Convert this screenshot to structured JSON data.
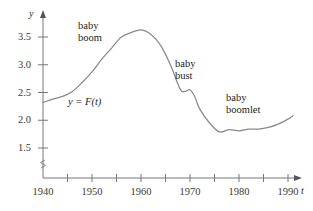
{
  "figure": {
    "name": "us-birth-rate-figure",
    "curve_label": "y = F(t)",
    "axis_x_name": "t",
    "axis_y_name": "y",
    "line_color": "#8a8a8d",
    "axis_color": "#77777a",
    "background": "#ffffff"
  },
  "annotations": [
    {
      "id": "baby-boom",
      "line1": "baby",
      "line2": "boom",
      "x": 78,
      "y": 20
    },
    {
      "id": "baby-bust",
      "line1": "baby",
      "line2": "bust",
      "x": 175,
      "y": 58
    },
    {
      "id": "baby-boomlet",
      "line1": "baby",
      "line2": "boomlet",
      "x": 226,
      "y": 92
    }
  ],
  "chart_data": {
    "type": "line",
    "title": "",
    "subtitle": "",
    "xlabel": "t",
    "ylabel": "y",
    "legend": [
      "y = F(t)"
    ],
    "legend_position": "inline-on-curve",
    "grid": false,
    "xlim": [
      1940,
      1993
    ],
    "ylim": [
      1.25,
      3.8
    ],
    "y_axis_break": true,
    "y_axis_break_note": "zig-zag break between origin and 1.5",
    "xticks": [
      1940,
      1950,
      1960,
      1970,
      1980,
      1990
    ],
    "xticks_minor": [
      1945,
      1955,
      1965,
      1975,
      1985
    ],
    "xtick_labels": [
      "1940",
      "1950",
      "1960",
      "1970",
      "1980",
      "1990"
    ],
    "yticks": [
      1.5,
      2.0,
      2.5,
      3.0,
      3.5
    ],
    "ytick_labels": [
      "1.5",
      "2.0",
      "2.5",
      "3.0",
      "3.5"
    ],
    "series": [
      {
        "name": "y = F(t)",
        "color": "#8a8a8d",
        "x": [
          1940,
          1942,
          1944,
          1946,
          1948,
          1950,
          1952,
          1954,
          1956,
          1958,
          1960,
          1962,
          1964,
          1966,
          1968,
          1969,
          1970,
          1971,
          1972,
          1974,
          1976,
          1978,
          1980,
          1982,
          1984,
          1986,
          1988,
          1990,
          1991
        ],
        "values": [
          2.32,
          2.38,
          2.43,
          2.52,
          2.68,
          2.87,
          3.1,
          3.3,
          3.5,
          3.58,
          3.63,
          3.55,
          3.35,
          3.0,
          2.56,
          2.52,
          2.55,
          2.42,
          2.2,
          1.95,
          1.79,
          1.83,
          1.81,
          1.84,
          1.84,
          1.87,
          1.93,
          2.02,
          2.08
        ],
        "annotations": [
          {
            "label": "baby boom",
            "period": "1946-1964",
            "peak_year": 1960,
            "peak_value": 3.63
          },
          {
            "label": "baby bust",
            "period": "1965-1976",
            "min_year": 1976,
            "min_value": 1.79
          },
          {
            "label": "baby boomlet",
            "period": "1977-1991",
            "end_year": 1991,
            "end_value": 2.08
          }
        ]
      }
    ]
  }
}
